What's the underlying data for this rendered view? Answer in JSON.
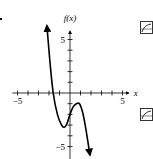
{
  "chart_data": {
    "type": "line",
    "title": "",
    "xlabel": "x",
    "ylabel": "f(x)",
    "xlim": [
      -5.5,
      5.5
    ],
    "ylim": [
      -6,
      7
    ],
    "x_tick_labels": [
      "−5",
      "5"
    ],
    "y_tick_labels": [
      "5",
      "−5"
    ],
    "grid": false,
    "series": [
      {
        "name": "f(x)",
        "x": [
          -2.2,
          -1.9,
          -1.6,
          -1.2,
          -0.8,
          -0.55,
          -0.3,
          0,
          0.3,
          0.6,
          0.9,
          1.2,
          1.5,
          1.9
        ],
        "y": [
          6.3,
          2.8,
          0,
          -2.0,
          -3.0,
          -3.2,
          -2.9,
          -2.0,
          -1.3,
          -1.0,
          -1.0,
          -1.8,
          -3.3,
          -5.8
        ]
      }
    ],
    "annotations": [
      "arrow at upper end",
      "arrow at lower end"
    ]
  },
  "icons": {
    "top": "graph-thumbnail-icon",
    "bottom": "graph-thumbnail-icon"
  },
  "colors": {
    "curve": "#000000",
    "axes": "#000000"
  }
}
